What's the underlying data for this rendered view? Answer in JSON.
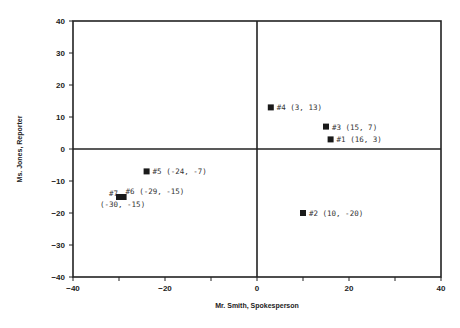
{
  "chart_data": {
    "type": "scatter",
    "title": "",
    "xlabel": "Mr. Smith, Spokesperson",
    "ylabel": "Ms. Jones, Reporter",
    "xlim": [
      -40,
      40
    ],
    "ylim": [
      -40,
      40
    ],
    "xticks": [
      -40,
      -20,
      0,
      20,
      40
    ],
    "yticks": [
      -40,
      -30,
      -20,
      -10,
      0,
      10,
      20,
      30,
      40
    ],
    "grid": false,
    "quadrant_lines": {
      "x": 0,
      "y": 0
    },
    "points": [
      {
        "id": "#1",
        "x": 16,
        "y": 3,
        "label": "#1 (16, 3)"
      },
      {
        "id": "#2",
        "x": 10,
        "y": -20,
        "label": "#2 (10, -20)"
      },
      {
        "id": "#3",
        "x": 15,
        "y": 7,
        "label": "#3 (15, 7)"
      },
      {
        "id": "#4",
        "x": 3,
        "y": 13,
        "label": "#4 (3, 13)"
      },
      {
        "id": "#5",
        "x": -24,
        "y": -7,
        "label": "#5 (-24, -7)"
      },
      {
        "id": "#6",
        "x": -29,
        "y": -15,
        "label": "#6 (-29, -15)"
      },
      {
        "id": "#7",
        "x": -30,
        "y": -15,
        "label": "#7 (-30, -15)"
      }
    ]
  }
}
